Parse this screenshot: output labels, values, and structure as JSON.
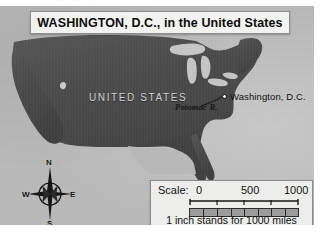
{
  "title": {
    "text": "WASHINGTON, D.C., in the United States"
  },
  "map": {
    "country_label": "UNITED STATES",
    "river_label": "Potomac R.",
    "city_label": "Washington, D.C.",
    "city_marker": "city-dot",
    "land_color": "#4a4a4a",
    "water_color": "#b9b9b9",
    "lake_color": "#c2c2c2"
  },
  "compass": {
    "north": "N",
    "south": "S",
    "east": "E",
    "west": "W"
  },
  "scale": {
    "label": "Scale:",
    "tick_0": "0",
    "tick_500": "500",
    "tick_1000": "1000",
    "caption": "1 inch stands for 1000 miles",
    "units": "miles",
    "segments": 8
  }
}
